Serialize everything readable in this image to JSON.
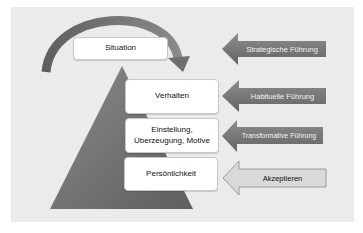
{
  "diagram": {
    "background_color": "#ebebeb",
    "layers": [
      {
        "label": "Situation"
      },
      {
        "label": "Verhalten"
      },
      {
        "label": "Einstellung,\nÜberzeugung, Motive"
      },
      {
        "label": "Persönlichkeit"
      }
    ],
    "arrows": [
      {
        "label": "Strategische Führung",
        "style": "dark"
      },
      {
        "label": "Habituelle Führung",
        "style": "dark"
      },
      {
        "label": "Transformative Führung",
        "style": "dark"
      },
      {
        "label": "Akzeptieren",
        "style": "light"
      }
    ],
    "colors": {
      "pyramid": "#6e6e6e",
      "arc": "#6a6a6a",
      "dark_arrow": "#757575",
      "light_arrow": "#d9d9d9"
    }
  }
}
